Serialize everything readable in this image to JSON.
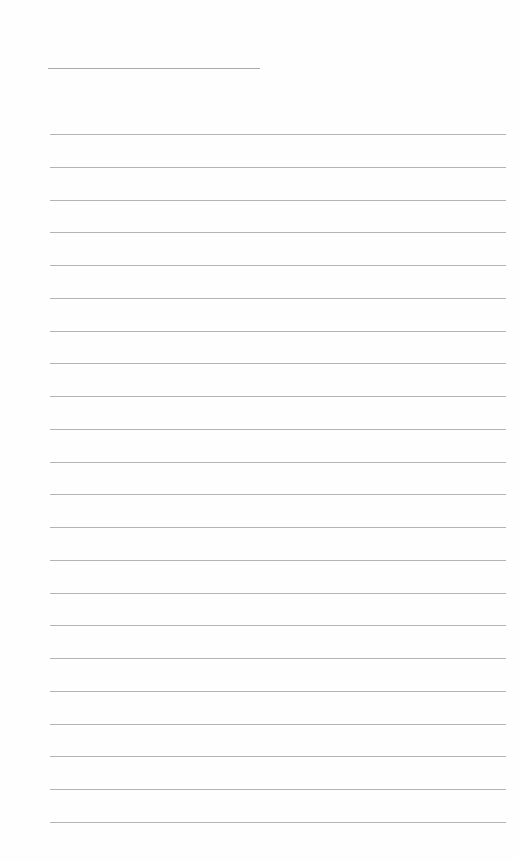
{
  "page": {
    "type": "lined-paper",
    "background": "#fefefe",
    "line_color": "#b4b4b4",
    "title_line": {
      "left": 48,
      "top": 68,
      "width": 212
    },
    "ruled_lines": {
      "count": 22,
      "left": 50,
      "width": 456,
      "first_top": 134,
      "spacing": 32.76
    }
  }
}
